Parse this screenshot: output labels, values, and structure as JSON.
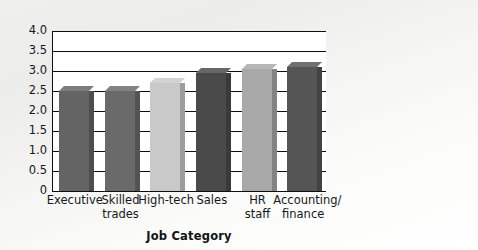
{
  "chart_data": {
    "type": "bar",
    "title": "",
    "subtitle": "",
    "xlabel": "Job Category",
    "ylabel": "",
    "categories": [
      "Executive",
      "Skilled trades",
      "High-tech",
      "Sales",
      "HR staff",
      "Accounting/ finance"
    ],
    "category_lines": [
      [
        "Executive"
      ],
      [
        "Skilled",
        "trades"
      ],
      [
        "High-tech"
      ],
      [
        "Sales"
      ],
      [
        "HR",
        "staff"
      ],
      [
        "Accounting/",
        "finance"
      ]
    ],
    "values": [
      2.5,
      2.5,
      2.7,
      2.95,
      3.05,
      3.1
    ],
    "bar_colors": [
      "#646464",
      "#6a6a6a",
      "#c9c9c9",
      "#4a4a4a",
      "#a8a8a8",
      "#555555"
    ],
    "ylim": [
      0,
      4.0
    ],
    "ytick_step": 0.5,
    "ytick_labels": [
      "4.0",
      "3.5",
      "3.0",
      "2.5",
      "2.0",
      "1.5",
      "1.0",
      "0.5",
      "0"
    ],
    "ytick_values": [
      4.0,
      3.5,
      3.0,
      2.5,
      2.0,
      1.5,
      1.0,
      0.5,
      0
    ],
    "grid": true,
    "legend": "none",
    "series": [
      {
        "name": "Mean rating",
        "values": [
          2.5,
          2.5,
          2.7,
          2.95,
          3.05,
          3.1
        ]
      }
    ]
  }
}
